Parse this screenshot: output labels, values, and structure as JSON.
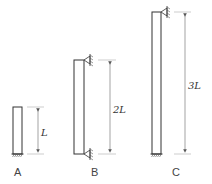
{
  "diagram": {
    "columns": [
      {
        "id": "A",
        "label": "A",
        "length_label": "L",
        "top_support": "free",
        "bottom_support": "fixed"
      },
      {
        "id": "B",
        "label": "B",
        "length_label": "2L",
        "top_support": "pinned",
        "bottom_support": "pinned"
      },
      {
        "id": "C",
        "label": "C",
        "length_label": "3L",
        "top_support": "pinned",
        "bottom_support": "fixed"
      }
    ],
    "colors": {
      "stroke": "#333333",
      "dimension": "#666666",
      "background": "#ffffff"
    }
  }
}
